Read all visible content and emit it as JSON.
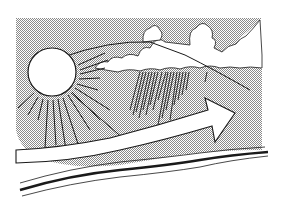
{
  "illustration": {
    "subject": "Sun, clouds with rain, upward arrow over ground line",
    "elements": [
      "sun",
      "sun-rays",
      "clouds",
      "rain-streaks",
      "arrow",
      "ground-line",
      "horizon-line"
    ],
    "colors": {
      "background": "#ffffff",
      "sky_shade": "#c8c8c8",
      "ink": "#1a1a1a",
      "fill_white": "#ffffff"
    }
  }
}
